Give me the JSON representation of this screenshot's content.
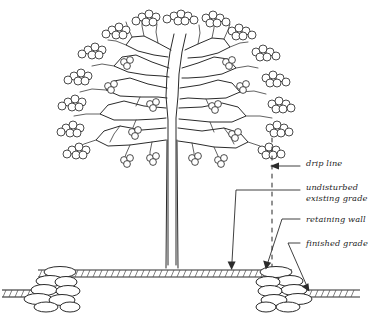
{
  "drawing": {
    "title": "Tree Protection / Retaining Wall Section Detail",
    "medium": "hand-drawn ink line drawing",
    "background_color": "#ffffff",
    "ink_color": "#2b2b2b"
  },
  "callouts": [
    {
      "id": "drip-line",
      "label": "drip line",
      "leader": "horizontal leader pointing left to the vertical dashed line at the canopy edge"
    },
    {
      "id": "undisturbed-existing-grade",
      "label": "undisturbed\nexisting grade",
      "leader": "horizontal leader turning down to the original grade inside the wall"
    },
    {
      "id": "retaining-wall",
      "label": "retaining wall",
      "leader": "short leader angling down-left to the stacked stone wall"
    },
    {
      "id": "finished-grade",
      "label": "finished grade",
      "leader": "leader angling down-left to the lowered grade outside the wall"
    }
  ],
  "elements": {
    "tree_canopy": "broad rounded deciduous canopy with clustered foliage puffs on branch tips",
    "trunk": "single straight central trunk",
    "drip_line": "vertical dashed line dropped from the outer canopy edge to the wall",
    "existing_grade": "hatched horizontal ground band at tree base held at original level",
    "finished_grade": "hatched ground band stepped down beyond each retaining wall",
    "retaining_wall_left": "stacked rounded fieldstone wall",
    "retaining_wall_right": "stacked rounded fieldstone wall"
  },
  "colors": {
    "ink": "#2b2b2b",
    "hatch": "#4a4a4a",
    "paper": "#ffffff"
  }
}
